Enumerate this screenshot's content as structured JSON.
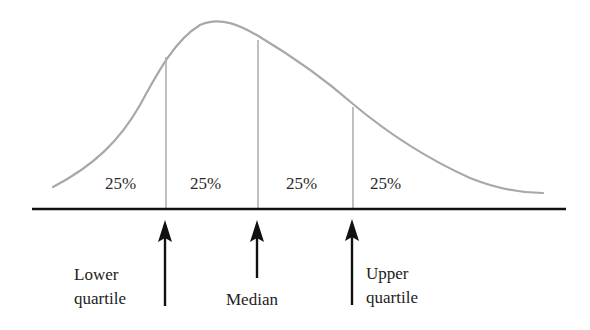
{
  "diagram": {
    "type": "right-skewed distribution with quartiles",
    "curve_color": "#a8a8a8",
    "divider_color": "#b0b0b0",
    "axis_color": "#111111",
    "arrow_color": "#111111",
    "regions": [
      {
        "label": "25%"
      },
      {
        "label": "25%"
      },
      {
        "label": "25%"
      },
      {
        "label": "25%"
      }
    ],
    "markers": [
      {
        "name": "lower-quartile",
        "line1": "Lower",
        "line2": "quartile"
      },
      {
        "name": "median",
        "line1": "Median",
        "line2": ""
      },
      {
        "name": "upper-quartile",
        "line1": "Upper",
        "line2": "quartile"
      }
    ]
  }
}
